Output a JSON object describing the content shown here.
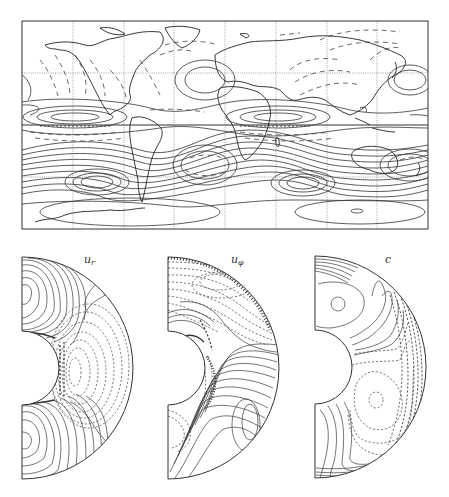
{
  "figure": {
    "top_panel": {
      "type": "global contour map (cylindrical projection) with continental outlines",
      "grid": {
        "meridians_count": 7,
        "parallels": [
          "dotted",
          "solid-equator",
          "dotted"
        ],
        "columns": 8,
        "rows": 4
      },
      "contour_styles": {
        "positive": "solid",
        "negative": "dashed"
      }
    },
    "bottom_panels": [
      {
        "id": "ur",
        "label_main": "u",
        "label_sub": "r",
        "type": "meridional hemisphere contour plot"
      },
      {
        "id": "uphi",
        "label_main": "u",
        "label_sub": "φ",
        "type": "meridional hemisphere contour plot"
      },
      {
        "id": "c",
        "label_main": "c",
        "label_sub": "",
        "type": "meridional hemisphere contour plot"
      }
    ],
    "colors": {
      "line": "#333333",
      "background": "#ffffff"
    }
  }
}
